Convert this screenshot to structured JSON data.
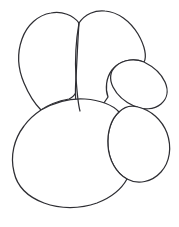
{
  "artwork": {
    "title": "Line art outline drawing",
    "description": "Black and white coloring-book style outline composed of five overlapping rounded organic shapes forming a snail-like figure",
    "style": "line-art-outline",
    "background_color": "#ffffff",
    "stroke_color": "#2e2e33",
    "stroke_width": 1.25,
    "fill_color": "#ffffff",
    "canvas": {
      "width": 179,
      "height": 227
    },
    "shapes": [
      {
        "id": "petal-upper-left",
        "name": "upper-left-petal",
        "role": "large rounded teardrop leaf at top left",
        "path": "M 79 23 C 73 15 62 11 51 13 C 38 15 27 25 22 39 C 17 53 18 69 24 83 C 29 95 35 104 41 110 C 48 105 58 101 69 99 C 76 96 79 88 80 78 C 81 60 81 38 79 23 Z"
      },
      {
        "id": "petal-upper-right",
        "name": "upper-right-petal",
        "role": "large rounded teardrop leaf at top center-right",
        "path": "M 79 23 C 85 14 95 10 105 11 C 118 12 130 21 138 34 C 145 46 147 57 144 62 C 132 57 119 61 112 70 C 106 78 105 89 108 97 C 104 104 97 110 89 113 C 84 115 80 114 78 111 C 75 104 75 92 76 78 C 77 60 78 36 79 23 Z"
      },
      {
        "id": "blob-middle-right",
        "name": "middle-right-blob",
        "role": "small round blob on right side",
        "path": "M 144 62 C 152 66 161 73 165 82 C 169 91 167 99 161 104 C 154 110 143 110 134 106 C 125 102 117 95 113 87 C 109 79 110 71 116 66 C 123 60 134 58 144 62 Z"
      },
      {
        "id": "oval-lower-right",
        "name": "lower-right-oval",
        "role": "oval blob at lower right overlapping body",
        "path": "M 138 107 C 151 110 162 120 167 133 C 172 147 170 162 161 172 C 152 182 138 185 127 179 C 116 173 109 160 108 146 C 107 132 111 119 119 112 C 124 107 131 105 138 107 Z"
      },
      {
        "id": "body-large",
        "name": "large-body-oval",
        "role": "large rounded body oval at bottom",
        "path": "M 41 110 C 55 102 70 98 85 99 C 100 100 113 105 119 112 C 111 119 107 132 108 146 C 109 160 116 173 127 179 C 121 190 110 198 97 203 C 80 209 60 209 44 203 C 28 197 17 186 14 172 C 10 156 14 139 24 126 C 29 119 35 114 41 110 Z"
      }
    ],
    "strokes": [
      {
        "id": "seam-petals",
        "name": "petal-divider-seam",
        "role": "curved line separating the two upper petals",
        "path": "M 79 23 C 76 40 75 62 76 78 C 77 92 78 104 80 111"
      }
    ]
  }
}
